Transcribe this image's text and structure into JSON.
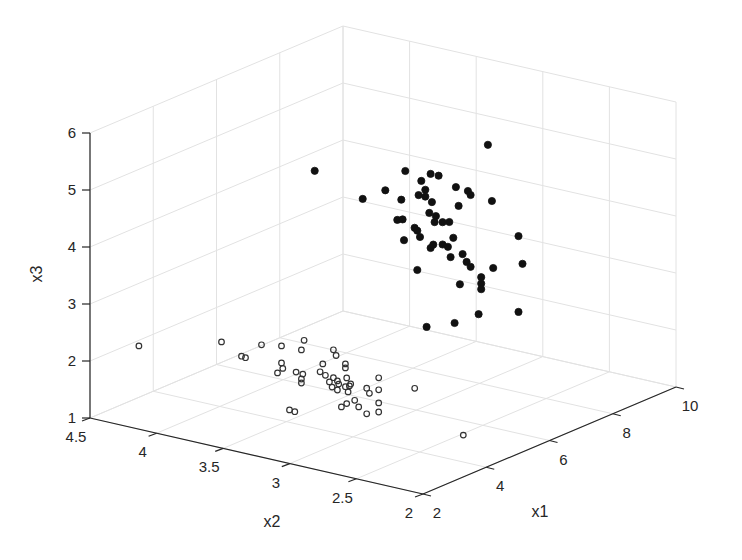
{
  "chart_data": {
    "type": "scatter",
    "dimensions": 3,
    "title": "",
    "xlabel": "x1",
    "ylabel": "x2",
    "zlabel": "x3",
    "xlim": [
      2,
      10
    ],
    "ylim": [
      2,
      4.5
    ],
    "zlim": [
      1,
      6
    ],
    "xticks": [
      "2",
      "4",
      "6",
      "8",
      "10"
    ],
    "yticks": [
      "2",
      "2.5",
      "3",
      "3.5",
      "4",
      "4.5"
    ],
    "zticks": [
      "1",
      "2",
      "3",
      "4",
      "5",
      "6"
    ],
    "grid": true,
    "legend": null,
    "series": [
      {
        "name": "cluster-filled",
        "marker": "filled-circle",
        "color": "#111111",
        "points": [
          [
            7,
            4.0,
            4.43
          ],
          [
            7,
            2.7,
            5.58
          ],
          [
            7,
            3.32,
            4.79
          ],
          [
            7,
            3.13,
            4.84
          ],
          [
            7,
            3.07,
            4.84
          ],
          [
            7,
            3.2,
            4.68
          ],
          [
            7,
            3.17,
            4.54
          ],
          [
            7,
            2.94,
            4.71
          ],
          [
            7,
            2.85,
            4.69
          ],
          [
            7,
            2.83,
            4.63
          ],
          [
            7,
            2.67,
            4.61
          ],
          [
            7,
            3.64,
            4.13
          ],
          [
            7,
            3.47,
            4.37
          ],
          [
            7,
            3.35,
            4.27
          ],
          [
            7,
            3.22,
            4.42
          ],
          [
            7,
            3.17,
            4.42
          ],
          [
            7,
            3.12,
            4.35
          ],
          [
            7,
            2.92,
            4.39
          ],
          [
            7,
            3.38,
            3.9
          ],
          [
            7,
            3.34,
            3.93
          ],
          [
            7,
            3.14,
            4.15
          ],
          [
            7,
            3.1,
            4.01
          ],
          [
            7,
            3.09,
            4.12
          ],
          [
            7,
            2.99,
            4.07
          ],
          [
            7,
            3.04,
            4.04
          ],
          [
            7,
            2.47,
            4.1
          ],
          [
            7,
            3.33,
            3.57
          ],
          [
            7,
            3.25,
            3.83
          ],
          [
            7,
            3.23,
            3.79
          ],
          [
            7,
            3.21,
            3.69
          ],
          [
            7,
            3.13,
            3.54
          ],
          [
            7,
            3.11,
            3.61
          ],
          [
            7,
            3.04,
            3.65
          ],
          [
            7,
            3.0,
            3.63
          ],
          [
            7,
            2.96,
            3.81
          ],
          [
            7,
            2.98,
            3.46
          ],
          [
            7,
            2.89,
            3.56
          ],
          [
            7,
            2.86,
            3.44
          ],
          [
            7,
            2.83,
            3.37
          ],
          [
            7,
            2.66,
            3.44
          ],
          [
            7,
            2.44,
            3.63
          ],
          [
            7,
            3.23,
            3.1
          ],
          [
            7,
            2.91,
            3.02
          ],
          [
            7,
            2.75,
            3.23
          ],
          [
            7,
            2.75,
            3.12
          ],
          [
            7,
            2.75,
            3.02
          ],
          [
            7,
            2.77,
            2.57
          ],
          [
            7,
            2.47,
            2.77
          ],
          [
            7,
            2.95,
            2.32
          ],
          [
            7,
            3.16,
            2.14
          ]
        ]
      },
      {
        "name": "cluster-open",
        "marker": "open-circle",
        "color": "#333333",
        "points": [
          [
            3,
            4.37,
            2.1
          ],
          [
            3,
            3.75,
            2.5
          ],
          [
            3,
            3.6,
            2.33
          ],
          [
            3,
            3.57,
            2.32
          ],
          [
            3,
            3.45,
            2.61
          ],
          [
            3,
            3.3,
            2.67
          ],
          [
            3,
            3.13,
            2.86
          ],
          [
            3,
            3.15,
            2.68
          ],
          [
            3,
            3.3,
            2.37
          ],
          [
            3,
            3.29,
            2.28
          ],
          [
            3,
            3.33,
            2.18
          ],
          [
            3,
            3.19,
            2.27
          ],
          [
            3,
            3.15,
            2.17
          ],
          [
            3,
            3.14,
            2.26
          ],
          [
            3,
            3.15,
            2.1
          ],
          [
            3,
            2.99,
            2.52
          ],
          [
            3,
            3.01,
            2.37
          ],
          [
            3,
            2.91,
            2.81
          ],
          [
            3,
            2.89,
            2.72
          ],
          [
            3,
            2.97,
            2.33
          ],
          [
            3,
            2.94,
            2.23
          ],
          [
            3,
            2.91,
            2.32
          ],
          [
            3,
            2.92,
            2.15
          ],
          [
            3,
            2.88,
            2.28
          ],
          [
            3,
            2.87,
            2.23
          ],
          [
            3,
            2.88,
            2.12
          ],
          [
            3,
            2.82,
            2.21
          ],
          [
            3,
            2.78,
            2.28
          ],
          [
            3,
            2.82,
            2.54
          ],
          [
            3,
            2.82,
            2.61
          ],
          [
            3,
            2.81,
            2.37
          ],
          [
            3,
            2.79,
            2.24
          ],
          [
            3,
            2.8,
            2.13
          ],
          [
            3,
            2.75,
            2.01
          ],
          [
            3,
            2.81,
            1.92
          ],
          [
            3,
            2.85,
            1.84
          ],
          [
            3,
            2.72,
            1.91
          ],
          [
            3,
            2.66,
            2.27
          ],
          [
            3,
            2.64,
            2.19
          ],
          [
            3,
            2.66,
            1.82
          ],
          [
            3,
            2.57,
            2.5
          ],
          [
            3,
            2.57,
            2.29
          ],
          [
            3,
            2.57,
            2.06
          ],
          [
            3,
            2.57,
            1.9
          ],
          [
            3,
            3.24,
            1.58
          ],
          [
            3,
            3.2,
            1.57
          ],
          [
            3,
            2.3,
            2.46
          ],
          [
            5,
            2.41,
            1.11
          ]
        ]
      }
    ]
  }
}
